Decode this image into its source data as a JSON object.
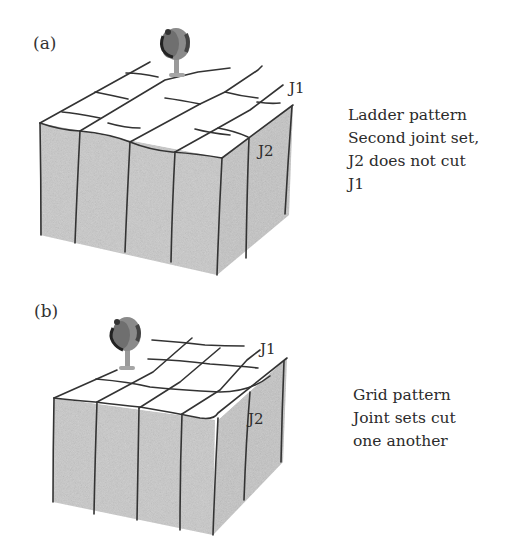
{
  "figure": {
    "panels": [
      {
        "id": "a",
        "label": "(a)",
        "pattern_name": "Ladder pattern",
        "caption_lines": [
          "Ladder pattern",
          "Second joint set,",
          "J2 does not cut",
          "J1"
        ],
        "joint_labels": {
          "j1": "J1",
          "j2": "J2"
        }
      },
      {
        "id": "b",
        "label": "(b)",
        "pattern_name": "Grid pattern",
        "caption_lines": [
          "Grid pattern",
          "Joint sets cut",
          "one another"
        ],
        "joint_labels": {
          "j1": "J1",
          "j2": "J2"
        }
      }
    ],
    "colors": {
      "rock_face": "#c9c9c9",
      "rock_face_side": "#bdbdbd",
      "top_surface": "#ffffff",
      "joint_line": "#333333",
      "tree_canopy_dark": "#3a3a3a",
      "tree_canopy_mid": "#8a8a8a",
      "tree_trunk": "#9a9a9a"
    }
  }
}
